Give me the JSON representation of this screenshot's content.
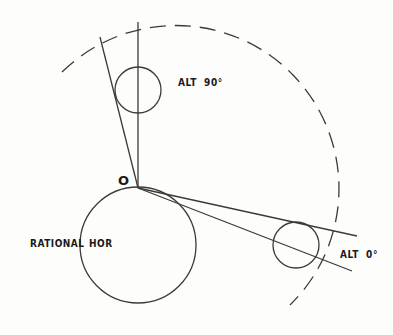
{
  "diagram": {
    "labels": {
      "origin": "O",
      "alt90": "ALT  90°",
      "alt0": "ALT  0°",
      "rational_horizon_left": "RATIONAL",
      "rational_horizon_right": "HOR"
    },
    "colors": {
      "background": "#fdfdfb",
      "stroke": "#3a3a3a",
      "text": "#1a1a1a"
    },
    "elements": {
      "earth_circle": {
        "cx": 138,
        "cy": 245,
        "r": 58
      },
      "top_circle": {
        "cx": 138,
        "cy": 90,
        "r": 23
      },
      "right_circle": {
        "cx": 296,
        "cy": 245,
        "r": 23
      },
      "origin_point": {
        "x": 138,
        "y": 188
      },
      "dashed_arc": {
        "cx": 138,
        "cy": 188,
        "r": 158
      }
    }
  }
}
